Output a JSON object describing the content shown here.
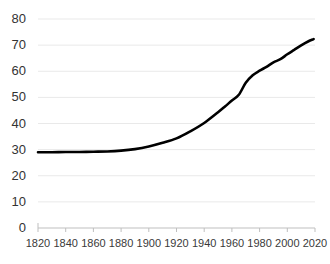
{
  "chart_data": {
    "type": "line",
    "title": "",
    "subtitle": "",
    "xlabel": "",
    "ylabel": "",
    "xlim": [
      1820,
      2020
    ],
    "ylim": [
      0,
      80
    ],
    "grid": true,
    "grid_axis": "y",
    "legend": false,
    "legend_position": "none",
    "line_color": "#000000",
    "line_width": 2.6,
    "grid_color": "#e9e9e9",
    "axis_color": "#bfbfbf",
    "background_color": "#ffffff",
    "xticks": [
      1820,
      1840,
      1860,
      1880,
      1900,
      1920,
      1940,
      1960,
      1980,
      2000,
      2020
    ],
    "xtick_labels": [
      "1820",
      "1840",
      "1860",
      "1880",
      "1900",
      "1920",
      "1940",
      "1960",
      "1980",
      "2000",
      "2020"
    ],
    "yticks": [
      0,
      10,
      20,
      30,
      40,
      50,
      60,
      70,
      80
    ],
    "ytick_labels": [
      "0",
      "10",
      "20",
      "30",
      "40",
      "50",
      "60",
      "70",
      "80"
    ],
    "series": [
      {
        "name": "series-1",
        "color": "#000000",
        "x": [
          1820,
          1830,
          1840,
          1850,
          1860,
          1870,
          1880,
          1890,
          1900,
          1910,
          1920,
          1930,
          1940,
          1950,
          1955,
          1960,
          1965,
          1970,
          1975,
          1980,
          1985,
          1990,
          1995,
          2000,
          2005,
          2010,
          2015,
          2019
        ],
        "values": [
          29.0,
          29.0,
          29.1,
          29.1,
          29.2,
          29.3,
          29.6,
          30.2,
          31.2,
          32.6,
          34.3,
          37.0,
          40.2,
          44.3,
          46.5,
          48.8,
          51.0,
          55.6,
          58.5,
          60.2,
          61.7,
          63.4,
          64.6,
          66.5,
          68.2,
          69.9,
          71.4,
          72.3
        ]
      }
    ]
  },
  "axis": {
    "y_axis_name": "y-axis",
    "x_axis_name": "x-axis"
  }
}
